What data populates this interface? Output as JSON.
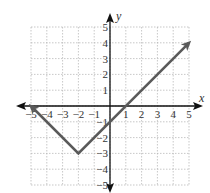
{
  "chart_data": {
    "type": "line",
    "title": "",
    "xlabel": "x",
    "ylabel": "y",
    "xlim": [
      -5,
      5
    ],
    "ylim": [
      -5,
      5
    ],
    "grid": true,
    "x_ticks": [
      "-5",
      "-4",
      "-3",
      "-2",
      "-1",
      "1",
      "2",
      "3",
      "4",
      "5"
    ],
    "y_ticks": [
      "5",
      "4",
      "3",
      "2",
      "1",
      "-1",
      "-2",
      "-3",
      "-4",
      "-5"
    ],
    "series": [
      {
        "name": "y = |x + 2| - 3",
        "x": [
          -5,
          -2,
          5
        ],
        "y": [
          0,
          -3,
          4
        ],
        "arrows": "both",
        "color": "#555555"
      }
    ],
    "vertex": [
      -2,
      -3
    ]
  },
  "colors": {
    "curve": "#5a5a5a",
    "axis": "#111111",
    "grid": "#b0b0b0"
  }
}
